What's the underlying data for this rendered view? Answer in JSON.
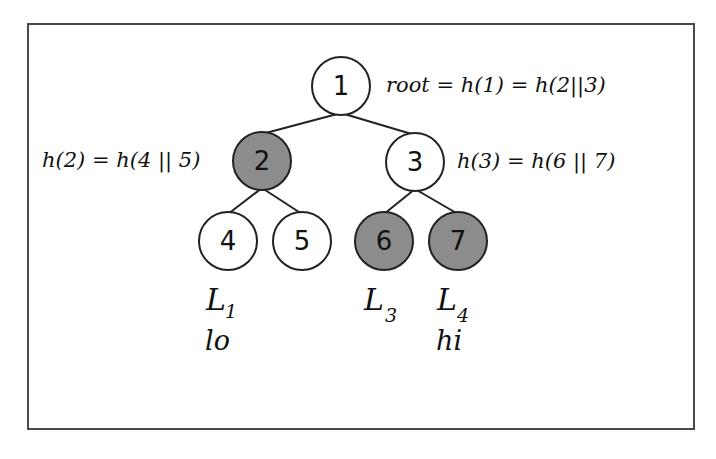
{
  "diagram": {
    "type": "merkle-tree",
    "colors": {
      "background": "#ffffff",
      "frame_border": "#4a4a4a",
      "edge": "#222222",
      "node_stroke": "#222222",
      "node_fill_white": "#ffffff",
      "node_fill_gray": "#8c8c8c"
    },
    "nodes": [
      {
        "id": "1",
        "label": "1",
        "cx": 341,
        "cy": 86,
        "fill": "white"
      },
      {
        "id": "2",
        "label": "2",
        "cx": 262,
        "cy": 161,
        "fill": "gray"
      },
      {
        "id": "3",
        "label": "3",
        "cx": 415,
        "cy": 162,
        "fill": "white"
      },
      {
        "id": "4",
        "label": "4",
        "cx": 228,
        "cy": 241,
        "fill": "white"
      },
      {
        "id": "5",
        "label": "5",
        "cx": 302,
        "cy": 241,
        "fill": "white"
      },
      {
        "id": "6",
        "label": "6",
        "cx": 384,
        "cy": 241,
        "fill": "gray"
      },
      {
        "id": "7",
        "label": "7",
        "cx": 458,
        "cy": 241,
        "fill": "gray"
      }
    ],
    "edges": [
      {
        "from": "1",
        "to": "2"
      },
      {
        "from": "1",
        "to": "3"
      },
      {
        "from": "2",
        "to": "4"
      },
      {
        "from": "2",
        "to": "5"
      },
      {
        "from": "3",
        "to": "6"
      },
      {
        "from": "3",
        "to": "7"
      }
    ],
    "annotations": {
      "root": "root = h(1) = h(2||3)",
      "node2": "h(2) = h(4 || 5)",
      "node3": "h(3) = h(6 || 7)"
    },
    "leaves": [
      {
        "node": "4",
        "label": "L",
        "sub": "1",
        "range": "lo"
      },
      {
        "node": "6",
        "label": "L",
        "sub": "3",
        "range": ""
      },
      {
        "node": "7",
        "label": "L",
        "sub": "4",
        "range": "hi"
      }
    ]
  }
}
